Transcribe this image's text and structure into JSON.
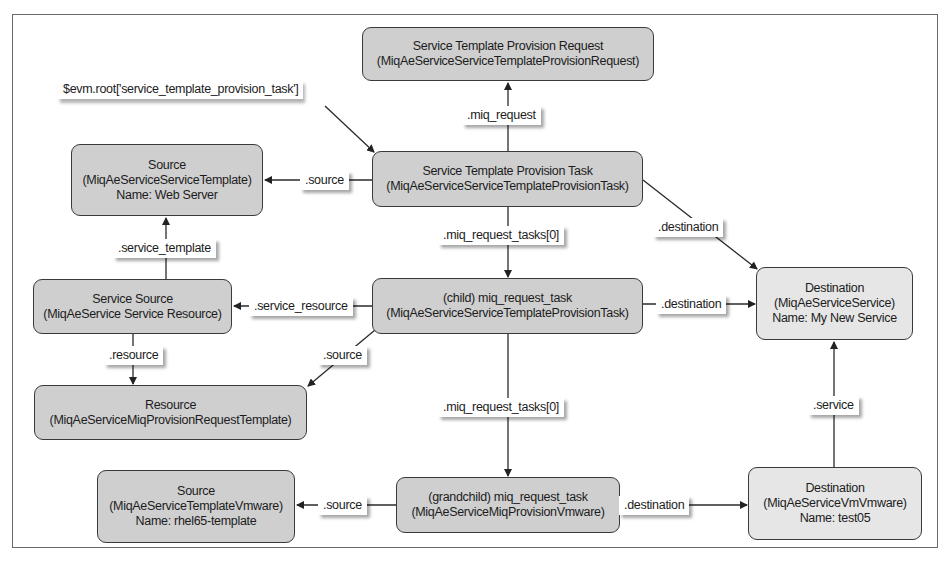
{
  "diagram": {
    "entry_label": "$evm.root['service_template_provision_task']",
    "nodes": {
      "request": {
        "title": "Service Template Provision Request",
        "class": "(MiqAeServiceServiceTemplateProvisionRequest)"
      },
      "task": {
        "title": "Service Template Provision Task",
        "class": "(MiqAeServiceServiceTemplateProvisionTask)"
      },
      "source_top": {
        "title": "Source",
        "class": "(MiqAeServiceServiceTemplate)",
        "name": "Name: Web Server"
      },
      "service_source": {
        "title": "Service Source",
        "class": "(MiqAeService Service Resource)"
      },
      "child": {
        "title": "(child) miq_request_task",
        "class": "(MiqAeServiceServiceTemplateProvisionTask)"
      },
      "resource": {
        "title": "Resource",
        "class": "(MiqAeServiceMiqProvisionRequestTemplate)"
      },
      "destination_top": {
        "title": "Destination",
        "class": "(MiqAeServiceService)",
        "name": "Name: My New Service"
      },
      "grandchild": {
        "title": "(grandchild) miq_request_task",
        "class": "(MiqAeServiceMiqProvisionVmware)"
      },
      "source_bottom": {
        "title": "Source",
        "class": "(MiqAeServiceTemplateVmware)",
        "name": "Name: rhel65-template"
      },
      "destination_bottom": {
        "title": "Destination",
        "class": "(MiqAeServiceVmVmware)",
        "name": "Name: test05"
      }
    },
    "edges": {
      "miq_request": ".miq_request",
      "task_source": ".source",
      "task_destination": ".destination",
      "task_tasks": ".miq_request_tasks[0]",
      "service_template": ".service_template",
      "service_resource": ".service_resource",
      "resource": ".resource",
      "child_source": ".source",
      "child_destination": ".destination",
      "child_tasks": ".miq_request_tasks[0]",
      "service": ".service",
      "grandchild_source": ".source",
      "grandchild_destination": ".destination"
    },
    "colors": {
      "node_fill": "#cfcfcf",
      "destination_fill": "#e6e6e6",
      "stroke": "#3a3a3a"
    }
  }
}
